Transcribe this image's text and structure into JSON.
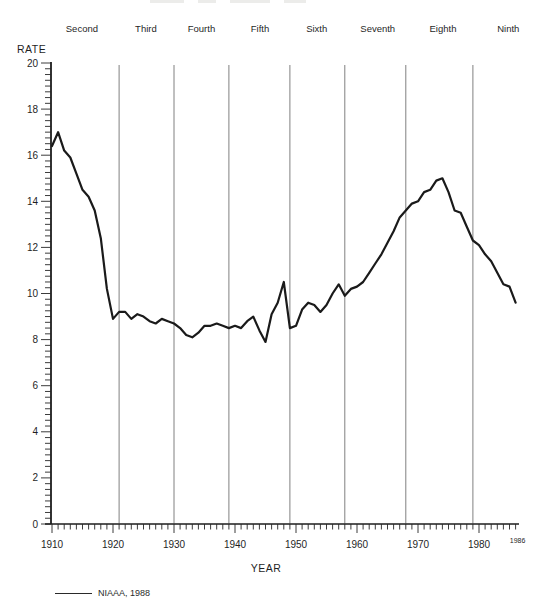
{
  "figure": {
    "ylabel": "RATE",
    "xlabel": "YEAR",
    "end_year_label": "1986",
    "source_note": "NIAAA, 1988"
  },
  "chart_data": {
    "type": "line",
    "title": "",
    "ylabel": "RATE",
    "xlabel": "YEAR",
    "ylim": [
      0,
      20
    ],
    "xlim": [
      1910,
      1986
    ],
    "grid": false,
    "legend_position": "none",
    "y_major_tick_step": 2,
    "y_minor_tick_step": 0.25,
    "x_decade_ticks": [
      1910,
      1920,
      1930,
      1940,
      1950,
      1960,
      1970,
      1980
    ],
    "x_minor_tick_step": 1,
    "end_tick_label": "1986",
    "line_color": "#1a1a1a",
    "divider_color": "#808080",
    "icd_revision_dividers": [
      1921,
      1930,
      1939,
      1949,
      1958,
      1968,
      1979
    ],
    "period_labels": [
      {
        "label": "Second",
        "center_year": 1914.9
      },
      {
        "label": "Third",
        "center_year": 1925.4
      },
      {
        "label": "Fourth",
        "center_year": 1934.5
      },
      {
        "label": "Fifth",
        "center_year": 1944.1
      },
      {
        "label": "Sixth",
        "center_year": 1953.4
      },
      {
        "label": "Seventh",
        "center_year": 1963.4
      },
      {
        "label": "Eighth",
        "center_year": 1974.1
      },
      {
        "label": "Ninth",
        "center_year": 1984.8
      }
    ],
    "x": [
      1910,
      1911,
      1912,
      1913,
      1914,
      1915,
      1916,
      1917,
      1918,
      1919,
      1920,
      1921,
      1922,
      1923,
      1924,
      1925,
      1926,
      1927,
      1928,
      1929,
      1930,
      1931,
      1932,
      1933,
      1934,
      1935,
      1936,
      1937,
      1938,
      1939,
      1940,
      1941,
      1942,
      1943,
      1944,
      1945,
      1946,
      1947,
      1948,
      1949,
      1950,
      1951,
      1952,
      1953,
      1954,
      1955,
      1956,
      1957,
      1958,
      1959,
      1960,
      1961,
      1962,
      1963,
      1964,
      1965,
      1966,
      1967,
      1968,
      1969,
      1970,
      1971,
      1972,
      1973,
      1974,
      1975,
      1976,
      1977,
      1978,
      1979,
      1980,
      1981,
      1982,
      1983,
      1984,
      1985,
      1986
    ],
    "values": [
      16.4,
      17.0,
      16.2,
      15.9,
      15.2,
      14.5,
      14.2,
      13.6,
      12.4,
      10.2,
      8.9,
      9.2,
      9.2,
      8.9,
      9.1,
      9.0,
      8.8,
      8.7,
      8.9,
      8.8,
      8.7,
      8.5,
      8.2,
      8.1,
      8.3,
      8.6,
      8.6,
      8.7,
      8.6,
      8.5,
      8.6,
      8.5,
      8.8,
      9.0,
      8.4,
      7.9,
      9.1,
      9.6,
      10.5,
      8.5,
      8.6,
      9.3,
      9.6,
      9.5,
      9.2,
      9.5,
      10.0,
      10.4,
      9.9,
      10.2,
      10.3,
      10.5,
      10.9,
      11.3,
      11.7,
      12.2,
      12.7,
      13.3,
      13.6,
      13.9,
      14.0,
      14.4,
      14.5,
      14.9,
      15.0,
      14.4,
      13.6,
      13.5,
      12.9,
      12.3,
      12.1,
      11.7,
      11.4,
      10.9,
      10.4,
      10.3,
      9.6
    ]
  }
}
